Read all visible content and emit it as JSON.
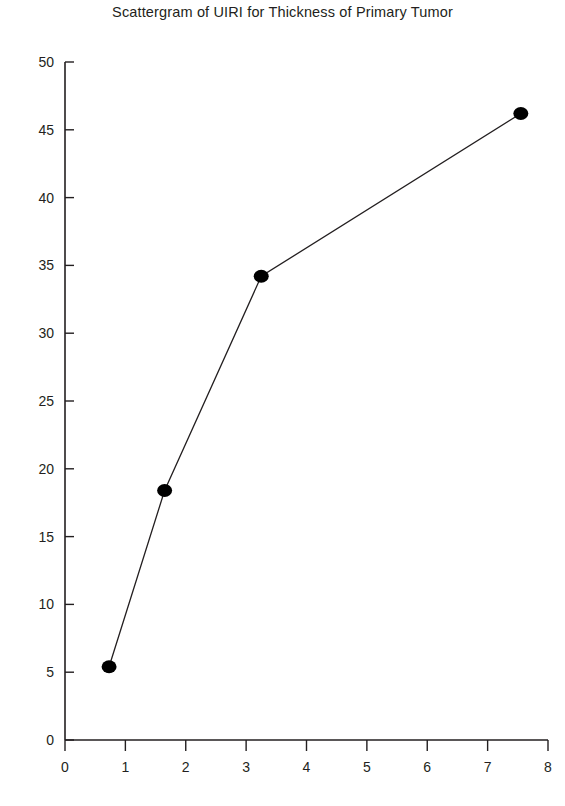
{
  "chart_data": {
    "type": "line",
    "title": "Scattergram of UIRI for Thickness of Primary Tumor",
    "xlabel": "",
    "ylabel": "",
    "xlim": [
      0,
      8
    ],
    "ylim": [
      0,
      50
    ],
    "xticks": [
      0,
      1,
      2,
      3,
      4,
      5,
      6,
      7,
      8
    ],
    "yticks": [
      0,
      5,
      10,
      15,
      20,
      25,
      30,
      35,
      40,
      45,
      50
    ],
    "grid": false,
    "legend": false,
    "legend_position": "none",
    "marker": "filled-circle",
    "marker_color": "#000000",
    "line_color": "#231f20",
    "axis_color": "#231f20",
    "series": [
      {
        "name": "UIRI",
        "points": [
          {
            "x": 0.73,
            "y": 5.4
          },
          {
            "x": 1.65,
            "y": 18.4
          },
          {
            "x": 3.25,
            "y": 34.2
          },
          {
            "x": 7.55,
            "y": 46.2
          }
        ]
      }
    ],
    "x": [
      0.73,
      1.65,
      3.25,
      7.55
    ],
    "values": [
      5.4,
      18.4,
      34.2,
      46.2
    ],
    "annotations": []
  },
  "axis": {
    "x_tick_labels": [
      "0",
      "1",
      "2",
      "3",
      "4",
      "5",
      "6",
      "7",
      "8"
    ],
    "y_tick_labels": [
      "0",
      "5",
      "10",
      "15",
      "20",
      "25",
      "30",
      "35",
      "40",
      "45",
      "50"
    ]
  }
}
